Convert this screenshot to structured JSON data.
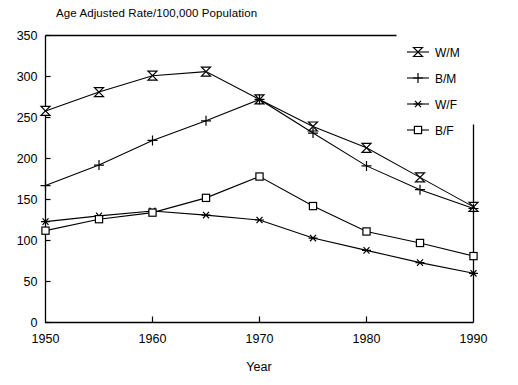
{
  "chart_data": {
    "type": "line",
    "title": "Age Adjusted Rate/100,000 Population",
    "xlabel": "Year",
    "ylabel": "",
    "xlim": [
      1950,
      1990
    ],
    "ylim": [
      0,
      350
    ],
    "xticks": [
      1950,
      1960,
      1970,
      1980,
      1990
    ],
    "yticks": [
      0,
      50,
      100,
      150,
      200,
      250,
      300,
      350
    ],
    "grid": false,
    "legend_position": "top-right",
    "x": [
      1950,
      1955,
      1960,
      1965,
      1970,
      1975,
      1980,
      1985,
      1990
    ],
    "series": [
      {
        "name": "W/M",
        "marker": "bowtie",
        "values": [
          258,
          281,
          301,
          306,
          272,
          239,
          213,
          177,
          141
        ]
      },
      {
        "name": "B/M",
        "marker": "plus",
        "values": [
          167,
          192,
          222,
          246,
          272,
          231,
          191,
          162,
          139
        ]
      },
      {
        "name": "W/F",
        "marker": "star",
        "values": [
          123,
          130,
          136,
          131,
          125,
          103,
          88,
          73,
          60
        ]
      },
      {
        "name": "B/F",
        "marker": "square",
        "values": [
          112,
          126,
          134,
          152,
          178,
          142,
          111,
          97,
          81
        ]
      }
    ]
  },
  "legend": {
    "entries": [
      {
        "label": "W/M"
      },
      {
        "label": "B/M"
      },
      {
        "label": "W/F"
      },
      {
        "label": "B/F"
      }
    ]
  },
  "axes": {
    "x_tick_labels": [
      "1950",
      "1960",
      "1970",
      "1980",
      "1990"
    ],
    "y_tick_labels": [
      "0",
      "50",
      "100",
      "150",
      "200",
      "250",
      "300",
      "350"
    ],
    "x_axis_title": "Year"
  },
  "colors": {
    "ink": "#000000",
    "background": "#ffffff"
  }
}
